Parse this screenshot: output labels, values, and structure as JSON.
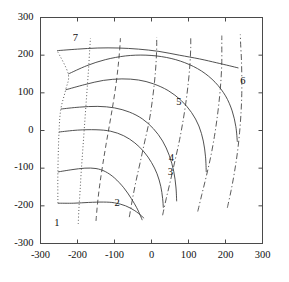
{
  "chart_data": {
    "type": "line",
    "title": "",
    "subtitle": "",
    "xlabel": "",
    "ylabel": "",
    "xlim": [
      -300,
      300
    ],
    "ylim": [
      -300,
      300
    ],
    "grid": false,
    "legend": "none",
    "axis": {
      "x_ticks": [
        -300,
        -200,
        -100,
        0,
        100,
        200,
        300
      ],
      "x_tick_labels": [
        "-300",
        "-200",
        "-100",
        "0",
        "100",
        "200",
        "300"
      ],
      "y_ticks": [
        -300,
        -200,
        -100,
        0,
        100,
        200,
        300
      ],
      "y_tick_labels": [
        "-300",
        "-200",
        "-100",
        "0",
        "100",
        "200",
        "300"
      ],
      "tick_direction": "out",
      "frame": "full-box"
    },
    "annotations": [
      {
        "label": "1",
        "x": -255,
        "y": -248
      },
      {
        "label": "2",
        "x": -92,
        "y": -196
      },
      {
        "label": "3",
        "x": 52,
        "y": -112
      },
      {
        "label": "4",
        "x": 55,
        "y": -75
      },
      {
        "label": "5",
        "x": 75,
        "y": 72
      },
      {
        "label": "6",
        "x": 248,
        "y": 130
      },
      {
        "label": "7",
        "x": -205,
        "y": 243
      }
    ],
    "series": [
      {
        "name": "h1",
        "style": "solid",
        "points": [
          [
            -253,
            -193
          ],
          [
            -210,
            -193
          ],
          [
            -170,
            -191
          ],
          [
            -130,
            -190
          ],
          [
            -100,
            -192
          ],
          [
            -70,
            -200
          ],
          [
            -45,
            -213
          ],
          [
            -28,
            -226
          ],
          [
            -20,
            -233
          ]
        ]
      },
      {
        "name": "h2",
        "style": "solid",
        "points": [
          [
            -253,
            -110
          ],
          [
            -215,
            -104
          ],
          [
            -180,
            -100
          ],
          [
            -150,
            -101
          ],
          [
            -125,
            -109
          ],
          [
            -100,
            -126
          ],
          [
            -75,
            -152
          ],
          [
            -55,
            -180
          ],
          [
            -40,
            -205
          ],
          [
            -30,
            -226
          ],
          [
            -25,
            -238
          ]
        ]
      },
      {
        "name": "h3",
        "style": "solid",
        "points": [
          [
            -250,
            -4
          ],
          [
            -200,
            1
          ],
          [
            -150,
            2
          ],
          [
            -110,
            -2
          ],
          [
            -75,
            -14
          ],
          [
            -45,
            -33
          ],
          [
            -20,
            -57
          ],
          [
            0,
            -85
          ],
          [
            15,
            -115
          ],
          [
            25,
            -148
          ],
          [
            30,
            -180
          ],
          [
            32,
            -205
          ]
        ]
      },
      {
        "name": "h4",
        "style": "solid",
        "points": [
          [
            -245,
            57
          ],
          [
            -195,
            62
          ],
          [
            -145,
            64
          ],
          [
            -100,
            60
          ],
          [
            -60,
            49
          ],
          [
            -25,
            31
          ],
          [
            5,
            5
          ],
          [
            30,
            -28
          ],
          [
            48,
            -66
          ],
          [
            60,
            -108
          ],
          [
            66,
            -150
          ],
          [
            68,
            -188
          ]
        ]
      },
      {
        "name": "h5",
        "style": "solid",
        "points": [
          [
            -232,
            108
          ],
          [
            -180,
            122
          ],
          [
            -130,
            133
          ],
          [
            -80,
            137
          ],
          [
            -35,
            134
          ],
          [
            5,
            124
          ],
          [
            45,
            106
          ],
          [
            80,
            80
          ],
          [
            108,
            48
          ],
          [
            128,
            12
          ],
          [
            140,
            -28
          ],
          [
            146,
            -70
          ],
          [
            148,
            -110
          ]
        ]
      },
      {
        "name": "h6",
        "style": "solid",
        "points": [
          [
            -225,
            150
          ],
          [
            -175,
            172
          ],
          [
            -125,
            188
          ],
          [
            -70,
            198
          ],
          [
            -15,
            200
          ],
          [
            40,
            194
          ],
          [
            90,
            180
          ],
          [
            135,
            158
          ],
          [
            172,
            128
          ],
          [
            200,
            92
          ],
          [
            218,
            52
          ],
          [
            228,
            10
          ],
          [
            232,
            -30
          ]
        ]
      },
      {
        "name": "h7",
        "style": "solid",
        "points": [
          [
            -255,
            212
          ],
          [
            -200,
            216
          ],
          [
            -145,
            219
          ],
          [
            -90,
            219
          ],
          [
            -35,
            216
          ],
          [
            20,
            210
          ],
          [
            75,
            200
          ],
          [
            130,
            190
          ],
          [
            175,
            180
          ],
          [
            210,
            172
          ],
          [
            235,
            166
          ]
        ]
      },
      {
        "name": "v1",
        "style": "dotted",
        "points": [
          [
            -253,
            -193
          ],
          [
            -253,
            -110
          ],
          [
            -250,
            -4
          ],
          [
            -245,
            57
          ],
          [
            -232,
            108
          ],
          [
            -225,
            150
          ],
          [
            -255,
            212
          ]
        ]
      },
      {
        "name": "v2",
        "style": "dotted",
        "points": [
          [
            -198,
            -248
          ],
          [
            -196,
            -205
          ],
          [
            -193,
            -160
          ],
          [
            -190,
            -110
          ],
          [
            -186,
            -55
          ],
          [
            -182,
            0
          ],
          [
            -178,
            55
          ],
          [
            -174,
            110
          ],
          [
            -170,
            165
          ],
          [
            -167,
            215
          ],
          [
            -165,
            245
          ]
        ]
      },
      {
        "name": "v3",
        "style": "dashed",
        "points": [
          [
            -150,
            -240
          ],
          [
            -146,
            -195
          ],
          [
            -140,
            -145
          ],
          [
            -132,
            -92
          ],
          [
            -123,
            -38
          ],
          [
            -113,
            18
          ],
          [
            -104,
            70
          ],
          [
            -96,
            122
          ],
          [
            -90,
            172
          ],
          [
            -86,
            215
          ],
          [
            -84,
            245
          ]
        ]
      },
      {
        "name": "v4",
        "style": "dashdot",
        "points": [
          [
            -60,
            -230
          ],
          [
            -52,
            -185
          ],
          [
            -42,
            -135
          ],
          [
            -30,
            -82
          ],
          [
            -18,
            -28
          ],
          [
            -6,
            26
          ],
          [
            2,
            78
          ],
          [
            8,
            128
          ],
          [
            12,
            175
          ],
          [
            14,
            218
          ],
          [
            14,
            248
          ]
        ]
      },
      {
        "name": "v5",
        "style": "dashdot",
        "points": [
          [
            30,
            -225
          ],
          [
            40,
            -180
          ],
          [
            52,
            -130
          ],
          [
            64,
            -78
          ],
          [
            76,
            -24
          ],
          [
            86,
            30
          ],
          [
            94,
            82
          ],
          [
            100,
            132
          ],
          [
            104,
            178
          ],
          [
            106,
            220
          ],
          [
            106,
            250
          ]
        ]
      },
      {
        "name": "v6",
        "style": "dashdot",
        "points": [
          [
            125,
            -215
          ],
          [
            136,
            -170
          ],
          [
            148,
            -122
          ],
          [
            160,
            -70
          ],
          [
            170,
            -16
          ],
          [
            178,
            38
          ],
          [
            184,
            90
          ],
          [
            188,
            138
          ],
          [
            190,
            183
          ],
          [
            190,
            224
          ],
          [
            190,
            252
          ]
        ]
      },
      {
        "name": "v7",
        "style": "dashdot",
        "points": [
          [
            205,
            -205
          ],
          [
            215,
            -160
          ],
          [
            224,
            -112
          ],
          [
            232,
            -60
          ],
          [
            238,
            -6
          ],
          [
            242,
            48
          ],
          [
            244,
            98
          ],
          [
            244,
            146
          ],
          [
            243,
            190
          ],
          [
            241,
            228
          ],
          [
            240,
            255
          ]
        ]
      }
    ]
  }
}
